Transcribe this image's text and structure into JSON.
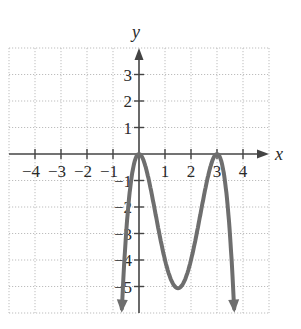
{
  "chart_data": {
    "type": "line",
    "title": "",
    "xlabel": "x",
    "ylabel": "y",
    "xlim": [
      -5,
      5
    ],
    "ylim": [
      -6,
      4
    ],
    "grid": true,
    "grid_style": "dotted",
    "x_ticks": [
      -4,
      -3,
      -2,
      -1,
      1,
      2,
      3,
      4
    ],
    "x_tick_labels": [
      "−4",
      "−3",
      "−2",
      "−1",
      "1",
      "2",
      "3",
      "4"
    ],
    "y_ticks": [
      3,
      2,
      1,
      -1,
      -2,
      -3,
      -4,
      -5
    ],
    "y_tick_labels": [
      "3",
      "2",
      "1",
      "−1",
      "−2",
      "−3",
      "−4",
      "−5"
    ],
    "series": [
      {
        "name": "f(x)",
        "description": "Quartic with double roots at x=0 and x=3, local minimum near (1.5, -5), both ends falling with arrows",
        "color": "#6e6e6e",
        "x": [
          -0.66,
          -0.5,
          -0.25,
          0,
          0.25,
          0.5,
          0.75,
          1,
          1.25,
          1.5,
          1.75,
          2,
          2.25,
          2.5,
          2.75,
          3,
          3.25,
          3.5,
          3.66
        ],
        "y": [
          -6.0,
          -3.06,
          -0.66,
          0,
          -0.47,
          -1.56,
          -2.85,
          -4.0,
          -4.79,
          -5.06,
          -4.79,
          -4.0,
          -2.85,
          -1.56,
          -0.47,
          0,
          -0.66,
          -3.06,
          -6.0
        ],
        "end_arrows": true
      }
    ],
    "key_points": [
      {
        "label": "root (double)",
        "x": 0,
        "y": 0
      },
      {
        "label": "root (double)",
        "x": 3,
        "y": 0
      },
      {
        "label": "local minimum",
        "x": 1.5,
        "y": -5
      }
    ]
  },
  "colors": {
    "axis": "#444444",
    "grid": "#bdbdbd",
    "curve": "#6e6e6e",
    "text": "#2a2a2a"
  }
}
